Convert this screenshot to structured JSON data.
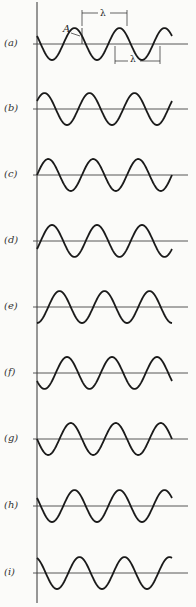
{
  "figure": {
    "axis_x": 37,
    "wavelength_px": 45,
    "amplitude_px": 16,
    "x_end": 172,
    "stroke_color": "#1a1a1a",
    "panels": [
      {
        "label": "(a)",
        "baseline": 44,
        "phase_deg": 150
      },
      {
        "label": "(b)",
        "baseline": 109,
        "phase_deg": 30
      },
      {
        "label": "(c)",
        "baseline": 175,
        "phase_deg": 0
      },
      {
        "label": "(d)",
        "baseline": 241,
        "phase_deg": -30
      },
      {
        "label": "(e)",
        "baseline": 307,
        "phase_deg": -90
      },
      {
        "label": "(f)",
        "baseline": 373,
        "phase_deg": -150
      },
      {
        "label": "(g)",
        "baseline": 439,
        "phase_deg": 180
      },
      {
        "label": "(h)",
        "baseline": 506,
        "phase_deg": 150
      },
      {
        "label": "(i)",
        "baseline": 573,
        "phase_deg": 110
      }
    ],
    "annotations": {
      "amplitude_symbol": "A",
      "wavelength_symbol_top": "λ",
      "wavelength_symbol_bottom": "λ"
    }
  }
}
